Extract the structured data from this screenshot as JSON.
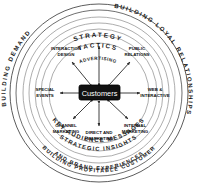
{
  "diagram": {
    "center": {
      "label": "Customers"
    },
    "outer_arcs": [
      {
        "id": "building-demand",
        "label": "BUILDING DEMAND",
        "position": "upper-left"
      },
      {
        "id": "building-loyal-relationships",
        "label": "BUILDING LOYAL RELATIONSHIPS",
        "position": "upper-right"
      },
      {
        "id": "building-profitable-customer",
        "label": "BUILDING PROFITABLE CUSTOMER",
        "position": "bottom-outer"
      },
      {
        "id": "and-brand-experiences",
        "label": "AND BRAND EXPERIENCES",
        "position": "bottom-outer-inner"
      }
    ],
    "ring_labels": [
      {
        "id": "strategy",
        "label": "STRATEGY",
        "position": "top"
      },
      {
        "id": "tactics",
        "label": "TACTICS",
        "position": "top"
      },
      {
        "id": "advertising",
        "label": "ADVERTISING",
        "position": "top-inner"
      },
      {
        "id": "key-audience-messages",
        "label": "KEY AUDIENCE MESSAGES",
        "position": "bottom"
      },
      {
        "id": "strategic-insights",
        "label": "STRATEGIC INSIGHTS",
        "position": "bottom"
      }
    ],
    "spoke_nodes": [
      {
        "id": "interaction-design",
        "line1": "INTERACTION",
        "line2": "DESIGN",
        "angle_deg": 225
      },
      {
        "id": "public-relations",
        "line1": "PUBLIC",
        "line2": "RELATIONS",
        "angle_deg": 315
      },
      {
        "id": "special-events",
        "line1": "SPECIAL",
        "line2": "EVENTS",
        "angle_deg": 180
      },
      {
        "id": "web-interactive",
        "line1": "WEB &",
        "line2": "INTERACTIVE",
        "angle_deg": 0
      },
      {
        "id": "channel-marketing",
        "line1": "CHANNEL",
        "line2": "MARKETING",
        "angle_deg": 135
      },
      {
        "id": "internal-marketing",
        "line1": "INTERNAL",
        "line2": "MARKETING",
        "angle_deg": 45
      },
      {
        "id": "direct-and-emarketing",
        "line1": "DIRECT AND",
        "line2": "eMARKETING",
        "angle_deg": 90
      }
    ],
    "colors": {
      "background": "#ffffff",
      "ring_stroke": "#4a4a4a",
      "ring_stroke_light": "#8a8a8a",
      "text": "#111111",
      "center_fill": "#111111",
      "center_text": "#ffffff",
      "arrow": "#2b2b2b"
    }
  }
}
